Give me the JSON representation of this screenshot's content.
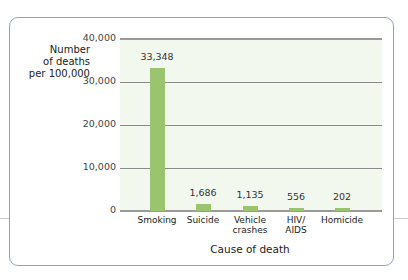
{
  "chart_data": {
    "type": "bar",
    "title": "",
    "xlabel": "Cause of death",
    "ylabel": "Number of deaths per 100,000",
    "ylabel_lines": [
      "Number",
      "of deaths",
      "per 100,000"
    ],
    "categories": [
      "Smoking",
      "Suicide",
      "Vehicle crashes",
      "HIV/ AIDS",
      "Homicide"
    ],
    "category_lines": [
      [
        "Smoking"
      ],
      [
        "Suicide"
      ],
      [
        "Vehicle",
        "crashes"
      ],
      [
        "HIV/",
        "AIDS"
      ],
      [
        "Homicide"
      ]
    ],
    "values": [
      33348,
      1686,
      1135,
      556,
      202
    ],
    "value_labels": [
      "33,348",
      "1,686",
      "1,135",
      "556",
      "202"
    ],
    "ylim": [
      0,
      40000
    ],
    "yticks": [
      0,
      10000,
      20000,
      30000,
      40000
    ],
    "ytick_labels": [
      "0",
      "10,000",
      "20,000",
      "30,000",
      "40,000"
    ],
    "grid": true,
    "legend": null,
    "colors": {
      "bar": "#9bc46f",
      "plot_bg": "#f2f8ee",
      "frame": "#8fa3c4"
    }
  }
}
